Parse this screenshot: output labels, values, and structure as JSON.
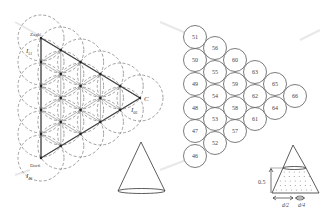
{
  "figure": {
    "left_panel": {
      "vertex_labels": {
        "top": "Zaglé",
        "bottom": "Dorñ",
        "right": "C"
      },
      "light_labels": {
        "top": "I",
        "top_sub": "51",
        "right": "I",
        "right_sub": "66",
        "bottom": "I",
        "bottom_sub": "46"
      }
    },
    "middle_panel": {
      "circles": [
        {
          "id": "51",
          "x": 195,
          "y": 37
        },
        {
          "id": "50",
          "x": 195,
          "y": 60
        },
        {
          "id": "49",
          "x": 195,
          "y": 84
        },
        {
          "id": "48",
          "x": 195,
          "y": 108
        },
        {
          "id": "47",
          "x": 195,
          "y": 131
        },
        {
          "id": "46",
          "x": 195,
          "y": 156
        },
        {
          "id": "56",
          "x": 215,
          "y": 48
        },
        {
          "id": "55",
          "x": 215,
          "y": 72
        },
        {
          "id": "54",
          "x": 215,
          "y": 96
        },
        {
          "id": "53",
          "x": 215,
          "y": 119
        },
        {
          "id": "52",
          "x": 215,
          "y": 143
        },
        {
          "id": "60",
          "x": 235,
          "y": 60
        },
        {
          "id": "59",
          "x": 235,
          "y": 84
        },
        {
          "id": "58",
          "x": 235,
          "y": 108
        },
        {
          "id": "57",
          "x": 235,
          "y": 131
        },
        {
          "id": "63",
          "x": 255,
          "y": 72
        },
        {
          "id": "62",
          "x": 255,
          "y": 96
        },
        {
          "id": "61",
          "x": 255,
          "y": 119
        },
        {
          "id": "65",
          "x": 275,
          "y": 84
        },
        {
          "id": "64",
          "x": 275,
          "y": 108
        },
        {
          "id": "66",
          "x": 295,
          "y": 96
        }
      ]
    },
    "frustum_panel": {
      "height_label": "0.5",
      "width_label_1": "d/2",
      "width_label_2": "d/4"
    }
  }
}
